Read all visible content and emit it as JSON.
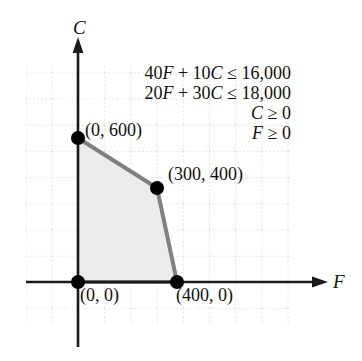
{
  "figure": {
    "axes": {
      "x_label": "F",
      "y_label": "C"
    },
    "constraints": [
      {
        "id": "c1",
        "text": "40F + 10C ≤ 16,000"
      },
      {
        "id": "c2",
        "text": "20F + 30C ≤ 18,000"
      },
      {
        "id": "c3",
        "text": "C ≥ 0"
      },
      {
        "id": "c4",
        "text": "F ≥ 0"
      }
    ],
    "vertices": [
      {
        "id": "v-0-600",
        "label": "(0, 600)",
        "x": 0,
        "y": 600
      },
      {
        "id": "v-300-400",
        "label": "(300, 400)",
        "x": 300,
        "y": 400
      },
      {
        "id": "v-400-0",
        "label": "(400, 0)",
        "x": 400,
        "y": 0
      },
      {
        "id": "v-0-0",
        "label": "(0, 0)",
        "x": 0,
        "y": 0
      }
    ],
    "colors": {
      "region_fill": "#ebebeb",
      "region_edge": "#808080",
      "axis": "#1a1a1a",
      "grid": "#bfbfbf",
      "vertex_dot": "#000000",
      "text": "#111111"
    }
  },
  "chart_data": {
    "type": "area",
    "title": "",
    "xlabel": "F",
    "ylabel": "C",
    "grid": true,
    "legend": "none",
    "xlim": [
      -200,
      820
    ],
    "ylim": [
      -300,
      860
    ],
    "annotations": [
      "40F + 10C ≤ 16,000",
      "20F + 30C ≤ 18,000",
      "C ≥ 0",
      "F ≥ 0"
    ],
    "series": [
      {
        "name": "Feasible region",
        "type": "polygon",
        "points": [
          [
            0,
            0
          ],
          [
            0,
            600
          ],
          [
            300,
            400
          ],
          [
            400,
            0
          ]
        ],
        "fill": "#ebebeb",
        "edge": "#808080"
      }
    ],
    "points": [
      {
        "label": "(0, 600)",
        "x": 0,
        "y": 600
      },
      {
        "label": "(300, 400)",
        "x": 300,
        "y": 400
      },
      {
        "label": "(400, 0)",
        "x": 400,
        "y": 0
      },
      {
        "label": "(0, 0)",
        "x": 0,
        "y": 0
      }
    ]
  }
}
